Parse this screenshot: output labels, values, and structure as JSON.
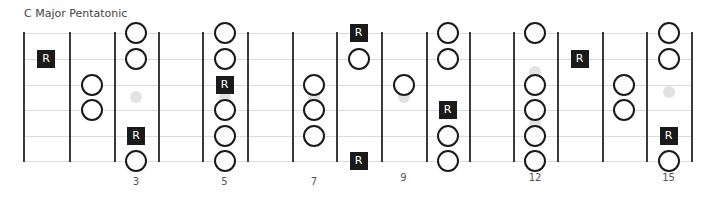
{
  "title": "C Major Pentatonic",
  "root_label": "R",
  "colors": {
    "fret_line": "#3a3a3a",
    "string_line": "#dcdcdc",
    "note_outline": "#1a1a1a",
    "root_fill": "#1a1a1a",
    "inlay": "#e2e2e2"
  },
  "fretboard": {
    "string_count": 6,
    "fret_count": 15,
    "string_y": [
      33,
      59,
      85,
      110,
      136,
      161
    ],
    "fret_x": [
      23,
      69,
      114,
      158,
      202,
      247,
      292,
      336,
      381,
      426,
      469,
      513,
      557,
      602,
      646,
      691
    ],
    "fret_labels": [
      {
        "fret": 3,
        "label": "3"
      },
      {
        "fret": 5,
        "label": "5"
      },
      {
        "fret": 7,
        "label": "7"
      },
      {
        "fret": 9,
        "label": "9"
      },
      {
        "fret": 12,
        "label": "12"
      },
      {
        "fret": 15,
        "label": "15"
      }
    ],
    "inlays": [
      {
        "fret": 3,
        "y": 97
      },
      {
        "fret": 5,
        "y": 97
      },
      {
        "fret": 7,
        "y": 97
      },
      {
        "fret": 9,
        "y": 97
      },
      {
        "fret": 12,
        "y": 72
      },
      {
        "fret": 12,
        "y": 123
      },
      {
        "fret": 15,
        "y": 92
      }
    ],
    "notes": [
      {
        "fret": 1,
        "string": 2,
        "type": "root"
      },
      {
        "fret": 2,
        "string": 3,
        "type": "note"
      },
      {
        "fret": 2,
        "string": 4,
        "type": "note"
      },
      {
        "fret": 3,
        "string": 1,
        "type": "note"
      },
      {
        "fret": 3,
        "string": 2,
        "type": "note"
      },
      {
        "fret": 3,
        "string": 5,
        "type": "root"
      },
      {
        "fret": 3,
        "string": 6,
        "type": "note"
      },
      {
        "fret": 5,
        "string": 1,
        "type": "note"
      },
      {
        "fret": 5,
        "string": 2,
        "type": "note"
      },
      {
        "fret": 5,
        "string": 3,
        "type": "root"
      },
      {
        "fret": 5,
        "string": 4,
        "type": "note"
      },
      {
        "fret": 5,
        "string": 5,
        "type": "note"
      },
      {
        "fret": 5,
        "string": 6,
        "type": "note"
      },
      {
        "fret": 7,
        "string": 3,
        "type": "note"
      },
      {
        "fret": 7,
        "string": 4,
        "type": "note"
      },
      {
        "fret": 7,
        "string": 5,
        "type": "note"
      },
      {
        "fret": 8,
        "string": 1,
        "type": "root"
      },
      {
        "fret": 8,
        "string": 2,
        "type": "note"
      },
      {
        "fret": 8,
        "string": 6,
        "type": "root"
      },
      {
        "fret": 9,
        "string": 3,
        "type": "note"
      },
      {
        "fret": 10,
        "string": 1,
        "type": "note"
      },
      {
        "fret": 10,
        "string": 2,
        "type": "note"
      },
      {
        "fret": 10,
        "string": 4,
        "type": "root"
      },
      {
        "fret": 10,
        "string": 5,
        "type": "note"
      },
      {
        "fret": 10,
        "string": 6,
        "type": "note"
      },
      {
        "fret": 12,
        "string": 1,
        "type": "note"
      },
      {
        "fret": 12,
        "string": 3,
        "type": "note"
      },
      {
        "fret": 12,
        "string": 4,
        "type": "note"
      },
      {
        "fret": 12,
        "string": 5,
        "type": "note"
      },
      {
        "fret": 12,
        "string": 6,
        "type": "note"
      },
      {
        "fret": 13,
        "string": 2,
        "type": "root"
      },
      {
        "fret": 14,
        "string": 3,
        "type": "note"
      },
      {
        "fret": 14,
        "string": 4,
        "type": "note"
      },
      {
        "fret": 15,
        "string": 1,
        "type": "note"
      },
      {
        "fret": 15,
        "string": 2,
        "type": "note"
      },
      {
        "fret": 15,
        "string": 5,
        "type": "root"
      },
      {
        "fret": 15,
        "string": 6,
        "type": "note"
      }
    ]
  }
}
